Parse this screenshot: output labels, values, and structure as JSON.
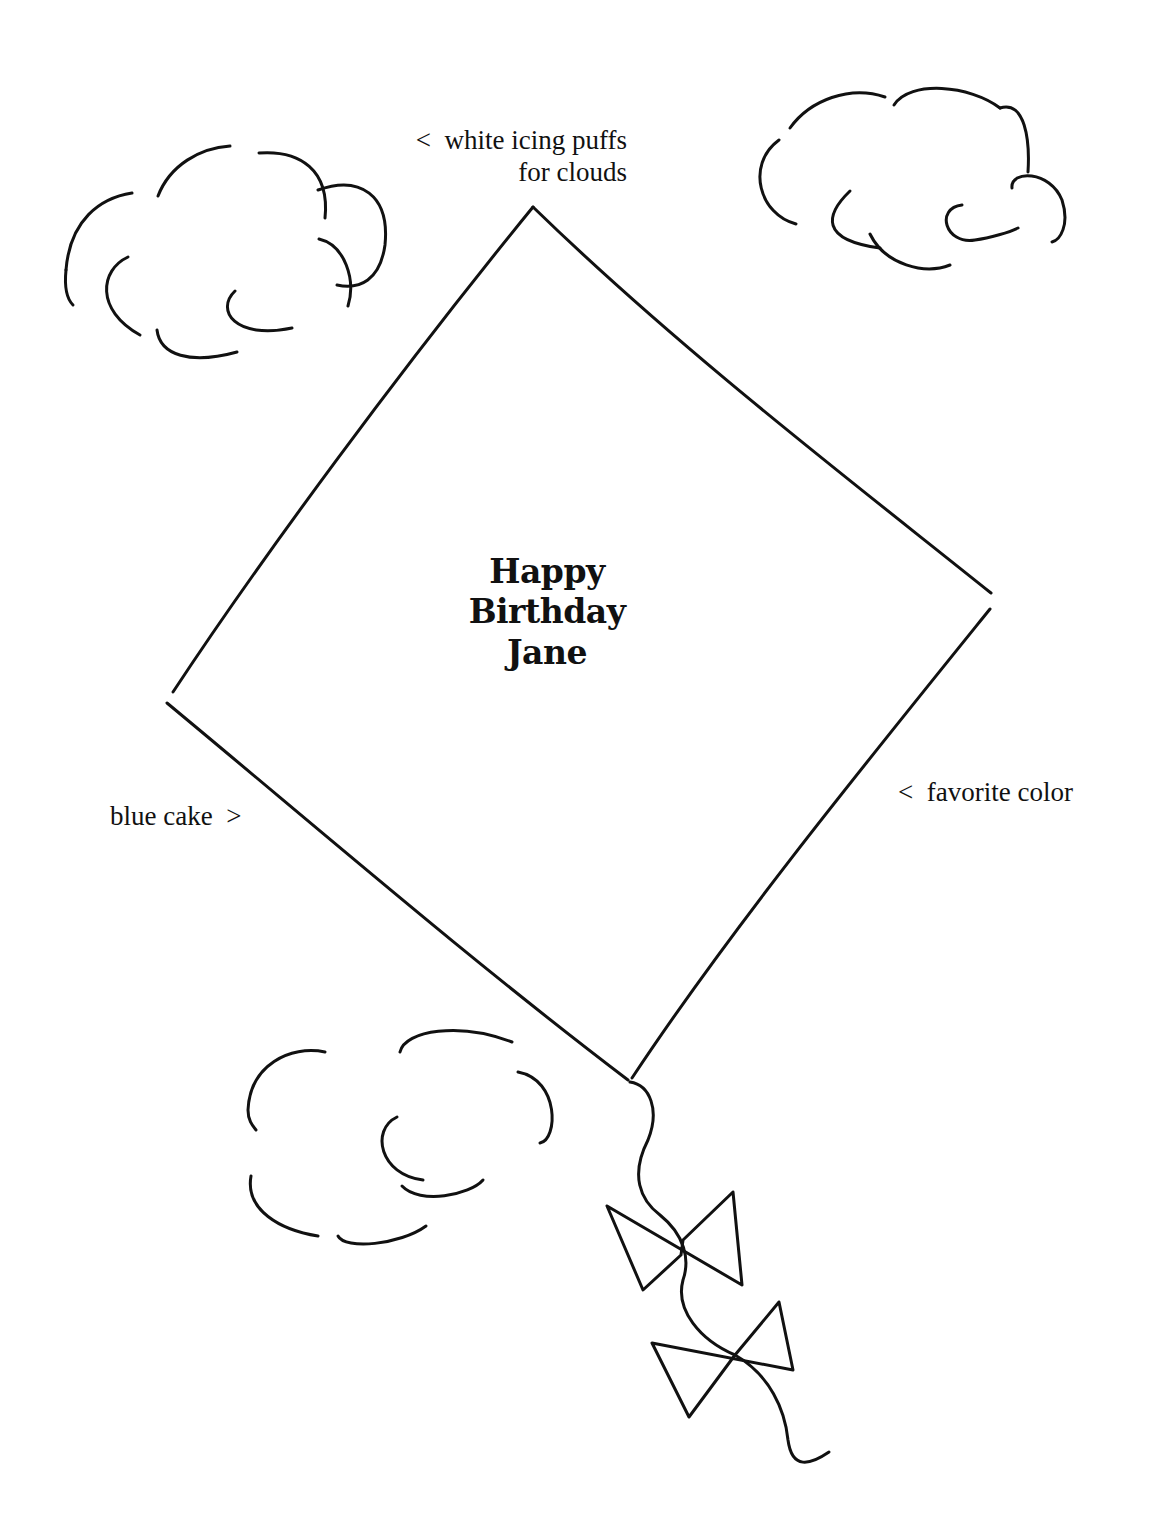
{
  "illustration": {
    "subject": "kite cake decorating guide",
    "stroke_color": "#111111",
    "background_color": "#ffffff"
  },
  "annotations": {
    "clouds": {
      "arrow": "<",
      "line1": "white icing puffs",
      "line2": "for clouds"
    },
    "cake": {
      "text": "blue cake",
      "arrow": ">"
    },
    "kite_color": {
      "arrow": "<",
      "text": "favorite color"
    }
  },
  "greeting": {
    "line1": "Happy",
    "line2": "Birthday",
    "line3": "Jane"
  }
}
